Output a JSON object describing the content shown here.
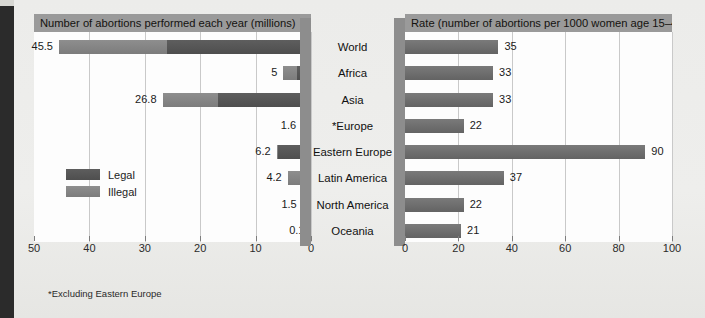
{
  "chart_data": [
    {
      "type": "bar",
      "id": "left",
      "title": "Number of abortions performed each year (millions)",
      "orientation": "horizontal",
      "direction": "right-to-left",
      "xlabel": "",
      "ylabel": "",
      "xlim": [
        0,
        50
      ],
      "reversed_axis": true,
      "ticks": [
        50,
        40,
        30,
        20,
        10,
        0
      ],
      "grid": true,
      "legend": [
        "Legal",
        "Illegal"
      ],
      "legend_position": "inside-left",
      "footnote": "*Excluding Eastern Europe",
      "categories": [
        "World",
        "Africa",
        "Asia",
        "*Europe",
        "Eastern Europe",
        "Latin America",
        "North America",
        "Oceania"
      ],
      "values": [
        45.5,
        5,
        26.8,
        1.6,
        6.2,
        4.2,
        1.5,
        0.1
      ],
      "labels": [
        "45.5",
        "5",
        "26.8",
        "1.6",
        "6.2",
        "4.2",
        "1.5",
        "0.1"
      ],
      "series": [
        {
          "name": "Legal",
          "values": [
            26.0,
            2.6,
            16.8,
            1.5,
            6.0,
            0.4,
            1.4,
            0.08
          ]
        },
        {
          "name": "Illegal",
          "values": [
            19.5,
            2.4,
            10.0,
            0.1,
            0.2,
            3.8,
            0.1,
            0.02
          ]
        }
      ]
    },
    {
      "type": "bar",
      "id": "right",
      "title": "Rate (number of abortions per 1000 women age 15–44)",
      "orientation": "horizontal",
      "direction": "left-to-right",
      "xlabel": "",
      "ylabel": "",
      "xlim": [
        0,
        100
      ],
      "ticks": [
        0,
        20,
        40,
        60,
        80,
        100
      ],
      "grid": true,
      "categories": [
        "World",
        "Africa",
        "Asia",
        "*Europe",
        "Eastern Europe",
        "Latin America",
        "North America",
        "Oceania"
      ],
      "values": [
        35,
        33,
        33,
        22,
        90,
        37,
        22,
        21
      ],
      "labels": [
        "35",
        "33",
        "33",
        "22",
        "90",
        "37",
        "22",
        "21"
      ]
    }
  ],
  "colors": {
    "legal": "#545454",
    "illegal": "#848484",
    "rate": "#6e6e6e",
    "title_bar": "#9a9a9a",
    "gutter": "#8d8d8d",
    "plot_bg": "#fdfdfd",
    "page_bg": "#ececea"
  }
}
